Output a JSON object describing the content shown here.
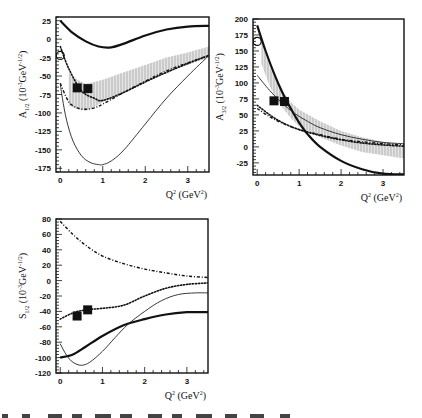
{
  "figure": {
    "caption_partial": "Figure 6. The comparison of the ... (caption truncated at image edge)"
  },
  "chart_data": [
    {
      "type": "line",
      "id": "a12",
      "title": "",
      "ylabel": "A1/2 (10^-3 GeV^-1/2)",
      "ylabel_main": "A",
      "ylabel_sub": "1/2",
      "ylabel_unit": "(10",
      "ylabel_exp": "-3",
      "ylabel_unit2": "GeV",
      "ylabel_exp2": "-1/2",
      "ylabel_close": ")",
      "xlabel": "Q^2 (GeV^2)",
      "xlim": [
        -0.1,
        3.5
      ],
      "ylim": [
        -180,
        30
      ],
      "xticks": [
        0,
        1,
        2,
        3
      ],
      "yticks": [
        25,
        0,
        -25,
        -50,
        -75,
        -100,
        -125,
        -150,
        -175
      ],
      "series": [
        {
          "name": "thick-solid",
          "style": "solid-thick",
          "x": [
            0,
            0.3,
            0.6,
            0.9,
            1.2,
            1.5,
            2.0,
            2.5,
            3.0,
            3.5
          ],
          "y": [
            25,
            8,
            -3,
            -10,
            -11,
            -6,
            5,
            13,
            17,
            18
          ]
        },
        {
          "name": "thin-solid",
          "style": "solid-thin",
          "x": [
            0,
            0.05,
            0.15,
            0.3,
            0.5,
            0.7,
            0.9,
            1.0,
            1.2,
            1.5,
            2.0,
            2.5,
            3.0,
            3.5
          ],
          "y": [
            -60,
            -80,
            -110,
            -138,
            -158,
            -167,
            -170,
            -170,
            -165,
            -150,
            -115,
            -80,
            -50,
            -22
          ]
        },
        {
          "name": "dotted",
          "style": "dotted",
          "x": [
            0,
            0.2,
            0.5,
            0.8,
            1.0,
            1.5,
            2.0,
            2.5,
            3.0,
            3.5
          ],
          "y": [
            -10,
            -40,
            -70,
            -80,
            -83,
            -72,
            -58,
            -45,
            -33,
            -22
          ]
        },
        {
          "name": "dash-dot",
          "style": "dashdot",
          "x": [
            0,
            0.2,
            0.4,
            0.6,
            0.8,
            1.0,
            1.5,
            2.0,
            2.5,
            3.0,
            3.5
          ],
          "y": [
            -60,
            -85,
            -93,
            -95,
            -93,
            -88,
            -72,
            -57,
            -43,
            -32,
            -22
          ]
        }
      ],
      "band": {
        "name": "hatched-band",
        "x": [
          0.2,
          0.4,
          0.6,
          0.8,
          1.0,
          1.5,
          2.0,
          2.5,
          3.0,
          3.5
        ],
        "low": [
          -90,
          -95,
          -97,
          -92,
          -85,
          -72,
          -58,
          -45,
          -35,
          -25
        ],
        "high": [
          -45,
          -55,
          -60,
          -58,
          -55,
          -45,
          -35,
          -25,
          -18,
          -10
        ]
      },
      "points": [
        {
          "marker": "open-circle",
          "x": 0,
          "y": -22
        },
        {
          "marker": "filled-square",
          "x": 0.4,
          "y": -66
        },
        {
          "marker": "filled-square",
          "x": 0.65,
          "y": -67
        }
      ]
    },
    {
      "type": "line",
      "id": "a32",
      "title": "",
      "ylabel": "A3/2 (10^-3 GeV^-1/2)",
      "ylabel_main": "A",
      "ylabel_sub": "3/2",
      "ylabel_unit": "(10",
      "ylabel_exp": "-3",
      "ylabel_unit2": "GeV",
      "ylabel_exp2": "-1/2",
      "ylabel_close": ")",
      "xlabel": "Q^2 (GeV^2)",
      "xlim": [
        -0.1,
        3.5
      ],
      "ylim": [
        -44,
        200
      ],
      "xticks": [
        0,
        1,
        2,
        3
      ],
      "yticks": [
        200,
        175,
        150,
        125,
        100,
        75,
        50,
        25,
        0,
        -25
      ],
      "series": [
        {
          "name": "thick-solid",
          "style": "solid-thick",
          "x": [
            0,
            0.2,
            0.4,
            0.6,
            0.8,
            1.0,
            1.2,
            1.5,
            2.0,
            2.5,
            3.0,
            3.5
          ],
          "y": [
            190,
            150,
            115,
            85,
            60,
            38,
            20,
            0,
            -22,
            -35,
            -42,
            -43
          ]
        },
        {
          "name": "thin-solid",
          "style": "solid-thin",
          "x": [
            0,
            0.3,
            0.6,
            0.9,
            1.2,
            1.5,
            2.0,
            2.5,
            3.0,
            3.5
          ],
          "y": [
            112,
            88,
            68,
            52,
            40,
            30,
            19,
            12,
            7,
            5
          ]
        },
        {
          "name": "dotted",
          "style": "dotted",
          "x": [
            0,
            0.3,
            0.6,
            1.0,
            1.5,
            2.0,
            2.5,
            3.0,
            3.5
          ],
          "y": [
            65,
            50,
            38,
            27,
            18,
            11,
            6,
            3,
            1
          ]
        },
        {
          "name": "dash-dot",
          "style": "dashdot",
          "x": [
            0,
            0.3,
            0.6,
            1.0,
            1.5,
            2.0,
            2.5,
            3.0,
            3.5
          ],
          "y": [
            60,
            47,
            37,
            27,
            19,
            12,
            8,
            5,
            3
          ]
        }
      ],
      "band": {
        "name": "hatched-band",
        "x": [
          0.1,
          0.3,
          0.5,
          0.8,
          1.0,
          1.5,
          2.0,
          2.5,
          3.0,
          3.5
        ],
        "low": [
          130,
          95,
          70,
          45,
          32,
          15,
          2,
          -8,
          -13,
          -18
        ],
        "high": [
          165,
          125,
          95,
          70,
          58,
          40,
          25,
          15,
          8,
          3
        ]
      },
      "points": [
        {
          "marker": "open-circle",
          "x": 0,
          "y": 165
        },
        {
          "marker": "filled-square",
          "x": 0.4,
          "y": 72
        },
        {
          "marker": "filled-square",
          "x": 0.65,
          "y": 71
        }
      ]
    },
    {
      "type": "line",
      "id": "s12",
      "title": "",
      "ylabel": "S1/2 (10^-3 GeV^-1/2)",
      "ylabel_main": "S",
      "ylabel_sub": "1/2",
      "ylabel_unit": "(10",
      "ylabel_exp": "-3",
      "ylabel_unit2": "GeV",
      "ylabel_exp2": "-1/2",
      "ylabel_close": ")",
      "xlabel": "Q^2 (GeV^2)",
      "xlim": [
        -0.1,
        3.5
      ],
      "ylim": [
        -120,
        80
      ],
      "xticks": [
        0,
        1,
        2,
        3
      ],
      "yticks": [
        80,
        60,
        40,
        20,
        0,
        -20,
        -40,
        -60,
        -80,
        -100,
        -120
      ],
      "series": [
        {
          "name": "thick-solid",
          "style": "solid-thick",
          "x": [
            0,
            0.3,
            0.6,
            1.0,
            1.5,
            2.0,
            2.5,
            3.0,
            3.5
          ],
          "y": [
            -100,
            -96,
            -86,
            -72,
            -58,
            -50,
            -44,
            -41,
            -41
          ]
        },
        {
          "name": "thin-solid",
          "style": "solid-thin",
          "x": [
            0,
            0.15,
            0.3,
            0.5,
            0.7,
            1.0,
            1.3,
            1.6,
            2.0,
            2.4,
            2.8,
            3.2,
            3.5
          ],
          "y": [
            -82,
            -97,
            -106,
            -110,
            -106,
            -92,
            -74,
            -57,
            -40,
            -26,
            -18,
            -16,
            -16
          ]
        },
        {
          "name": "dotted",
          "style": "dotted",
          "x": [
            0,
            0.3,
            0.6,
            1.0,
            1.5,
            2.0,
            2.5,
            3.0,
            3.5
          ],
          "y": [
            -50,
            -42,
            -38,
            -36,
            -32,
            -20,
            -10,
            -5,
            -3
          ]
        },
        {
          "name": "dash-dot",
          "style": "dashdot",
          "x": [
            0,
            0.3,
            0.6,
            1.0,
            1.5,
            2.0,
            2.5,
            3.0,
            3.5
          ],
          "y": [
            77,
            60,
            46,
            32,
            22,
            15,
            10,
            6,
            4
          ]
        }
      ],
      "points": [
        {
          "marker": "filled-square",
          "x": 0.4,
          "y": -46
        },
        {
          "marker": "filled-square",
          "x": 0.65,
          "y": -38
        }
      ]
    }
  ],
  "layout": {
    "panels": [
      {
        "id": "a12",
        "left": 56,
        "top": 17,
        "right": 209,
        "bottom": 172
      },
      {
        "id": "a32",
        "left": 253,
        "top": 19,
        "right": 404,
        "bottom": 175
      },
      {
        "id": "s12",
        "left": 56,
        "top": 219,
        "right": 208,
        "bottom": 373
      }
    ]
  }
}
